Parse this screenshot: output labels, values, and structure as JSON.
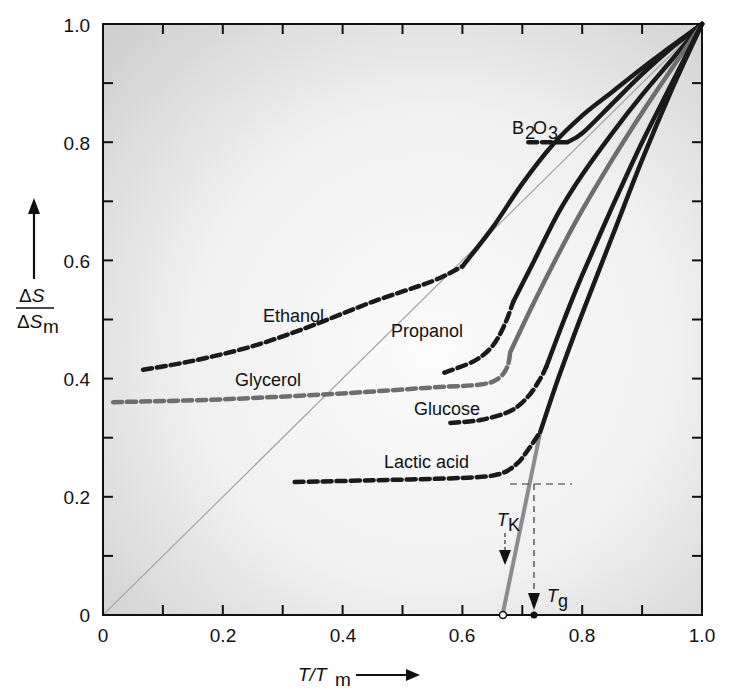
{
  "chart_data": {
    "type": "line",
    "title": "",
    "xlabel": "T/T_m",
    "ylabel": "ΔS/ΔS_m",
    "xlim": [
      0,
      1.0
    ],
    "ylim": [
      0,
      1.0
    ],
    "x_ticks": [
      "0",
      "0.2",
      "0.4",
      "0.6",
      "0.8",
      "1.0"
    ],
    "y_ticks": [
      "0",
      "0.2",
      "0.4",
      "0.6",
      "0.8",
      "1.0"
    ],
    "minor_tick_step": 0.1,
    "grid": false,
    "legend": "none (inline curve labels)",
    "background": "light gray vignette, white center",
    "series": [
      {
        "name": "B2O3",
        "label_main": "B",
        "label_sub1": "2",
        "label_mid": "O",
        "label_sub2": "3",
        "color": "#1a1a1a",
        "dashed": [
          [
            0.71,
            0.8
          ],
          [
            0.775,
            0.8
          ]
        ],
        "solid": [
          [
            0.775,
            0.8
          ],
          [
            0.8,
            0.815
          ],
          [
            0.85,
            0.865
          ],
          [
            0.9,
            0.915
          ],
          [
            0.95,
            0.96
          ],
          [
            1.0,
            1.0
          ]
        ]
      },
      {
        "name": "Ethanol",
        "color": "#1a1a1a",
        "dashed": [
          [
            0.067,
            0.415
          ],
          [
            0.15,
            0.43
          ],
          [
            0.25,
            0.455
          ],
          [
            0.35,
            0.49
          ],
          [
            0.45,
            0.53
          ],
          [
            0.55,
            0.565
          ],
          [
            0.6,
            0.59
          ]
        ],
        "solid": [
          [
            0.6,
            0.59
          ],
          [
            0.65,
            0.655
          ],
          [
            0.7,
            0.73
          ],
          [
            0.75,
            0.795
          ],
          [
            0.8,
            0.845
          ],
          [
            0.85,
            0.885
          ],
          [
            0.9,
            0.925
          ],
          [
            0.95,
            0.963
          ],
          [
            1.0,
            1.0
          ]
        ]
      },
      {
        "name": "Propanol",
        "color": "#1a1a1a",
        "dashed": [
          [
            0.57,
            0.41
          ],
          [
            0.62,
            0.43
          ],
          [
            0.65,
            0.455
          ],
          [
            0.67,
            0.49
          ],
          [
            0.685,
            0.53
          ]
        ],
        "solid": [
          [
            0.685,
            0.53
          ],
          [
            0.72,
            0.6
          ],
          [
            0.76,
            0.68
          ],
          [
            0.8,
            0.745
          ],
          [
            0.85,
            0.815
          ],
          [
            0.9,
            0.88
          ],
          [
            0.95,
            0.94
          ],
          [
            1.0,
            1.0
          ]
        ]
      },
      {
        "name": "Glycerol",
        "color": "#6e6e6e",
        "dashed": [
          [
            0.017,
            0.36
          ],
          [
            0.2,
            0.365
          ],
          [
            0.4,
            0.375
          ],
          [
            0.55,
            0.385
          ],
          [
            0.63,
            0.39
          ],
          [
            0.66,
            0.4
          ],
          [
            0.675,
            0.42
          ],
          [
            0.68,
            0.445
          ]
        ],
        "solid": [
          [
            0.68,
            0.445
          ],
          [
            0.72,
            0.53
          ],
          [
            0.76,
            0.61
          ],
          [
            0.8,
            0.685
          ],
          [
            0.85,
            0.77
          ],
          [
            0.9,
            0.85
          ],
          [
            0.95,
            0.925
          ],
          [
            1.0,
            1.0
          ]
        ]
      },
      {
        "name": "Glucose",
        "color": "#1a1a1a",
        "dashed": [
          [
            0.58,
            0.325
          ],
          [
            0.63,
            0.33
          ],
          [
            0.68,
            0.345
          ],
          [
            0.71,
            0.37
          ],
          [
            0.73,
            0.4
          ],
          [
            0.74,
            0.42
          ]
        ],
        "solid": [
          [
            0.74,
            0.42
          ],
          [
            0.77,
            0.5
          ],
          [
            0.8,
            0.575
          ],
          [
            0.85,
            0.69
          ],
          [
            0.9,
            0.8
          ],
          [
            0.95,
            0.9
          ],
          [
            1.0,
            1.0
          ]
        ]
      },
      {
        "name": "Lactic acid",
        "color": "#1a1a1a",
        "dashed": [
          [
            0.32,
            0.225
          ],
          [
            0.45,
            0.228
          ],
          [
            0.6,
            0.232
          ],
          [
            0.66,
            0.238
          ],
          [
            0.69,
            0.255
          ],
          [
            0.71,
            0.28
          ],
          [
            0.73,
            0.31
          ]
        ],
        "solid": [
          [
            0.73,
            0.31
          ],
          [
            0.76,
            0.4
          ],
          [
            0.8,
            0.51
          ],
          [
            0.85,
            0.64
          ],
          [
            0.9,
            0.77
          ],
          [
            0.95,
            0.89
          ],
          [
            1.0,
            1.0
          ]
        ]
      }
    ],
    "reference_line": {
      "name": "ΔS/ΔS_m = T/T_m",
      "color": "#a8a8a8",
      "points": [
        [
          0,
          0
        ],
        [
          1.0,
          1.0
        ]
      ]
    },
    "kauzmann_extrapolation": {
      "color": "#8c8c8c",
      "points": [
        [
          0.73,
          0.31
        ],
        [
          0.667,
          0.0
        ]
      ]
    },
    "annotations": [
      {
        "text": "T_K",
        "main": "T",
        "sub": "K",
        "x": 0.667,
        "y": 0,
        "marker": "open circle on x-axis",
        "arrow": "dashed down arrow"
      },
      {
        "text": "T_g",
        "main": "T",
        "sub": "g",
        "x": 0.72,
        "y": 0,
        "marker": "filled circle on x-axis",
        "arrow": "dashed vertical drop from lactic acid curve"
      },
      {
        "text": "horizontal dashed guide",
        "y": 0.23,
        "x_range": [
          0.68,
          0.78
        ]
      }
    ],
    "curve_labels": [
      "B2O3",
      "Ethanol",
      "Propanol",
      "Glycerol",
      "Glucose",
      "Lactic acid"
    ]
  }
}
